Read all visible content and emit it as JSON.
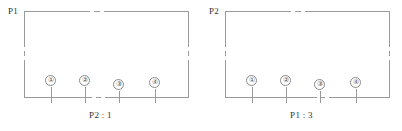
{
  "figure": {
    "type": "technical-line-drawing",
    "panel_count": 2,
    "line_color": "#9a9a9a",
    "text_color": "#2f2f2f",
    "background": "#ffffff"
  },
  "panels": [
    {
      "id": "P1",
      "corner_label": "P1",
      "caption": "P2 : 1",
      "markers": [
        {
          "label": "①",
          "x": 27,
          "stem_height": 16
        },
        {
          "label": "②",
          "x": 61,
          "stem_height": 16
        },
        {
          "label": "③",
          "x": 95,
          "stem_height": 12
        },
        {
          "label": "④",
          "x": 131,
          "stem_height": 14
        }
      ],
      "edge_breaks": {
        "top": "center",
        "bottom": "center",
        "left": "middle",
        "right": "middle"
      }
    },
    {
      "id": "P2",
      "corner_label": "P2",
      "caption": "P1 : 3",
      "markers": [
        {
          "label": "①",
          "x": 27,
          "stem_height": 16
        },
        {
          "label": "②",
          "x": 61,
          "stem_height": 16
        },
        {
          "label": "③",
          "x": 95,
          "stem_height": 12
        },
        {
          "label": "④",
          "x": 131,
          "stem_height": 14
        }
      ],
      "edge_breaks": {
        "top": "center",
        "bottom": "center",
        "left": "middle",
        "right": "middle"
      }
    }
  ]
}
